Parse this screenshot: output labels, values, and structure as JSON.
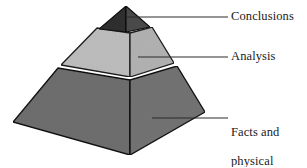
{
  "diagram": {
    "type": "labeled-pyramid-diagram",
    "background_color": "#ffffff",
    "tiers": [
      {
        "id": "apex",
        "label": "Conclusions",
        "level": 3,
        "position": "top",
        "fill_left": "#2f2f2f",
        "fill_right": "#4a4a4a",
        "outline_color": "#111111"
      },
      {
        "id": "middle",
        "label": "Analysis",
        "level": 2,
        "position": "middle",
        "fill_left": "#bcbcbc",
        "fill_right": "#b3b3b3",
        "outline_color": "#1a1a1a"
      },
      {
        "id": "base",
        "label": "Facts and\nphysical\nevidence",
        "label_lines": [
          "Facts and",
          "physical",
          "evidence"
        ],
        "level": 1,
        "position": "bottom",
        "fill_left": "#6e6e6e",
        "fill_right": "#6f6f6f",
        "outline_color": "#121212"
      }
    ],
    "leader_lines": [
      {
        "id": "leader-conclusions",
        "x1": 126,
        "y1": 17,
        "x2": 228,
        "y2": 17,
        "color": "#2b2b2b"
      },
      {
        "id": "leader-analysis",
        "x1": 138,
        "y1": 57,
        "x2": 228,
        "y2": 57,
        "color": "#2b2b2b"
      },
      {
        "id": "leader-facts",
        "x1": 152,
        "y1": 118,
        "x2": 228,
        "y2": 118,
        "color": "#2b2b2b"
      }
    ],
    "labels": {
      "conclusions": "Conclusions",
      "analysis": "Analysis",
      "facts_line1": "Facts and",
      "facts_line2": "physical",
      "facts_line3": "evidence"
    }
  }
}
